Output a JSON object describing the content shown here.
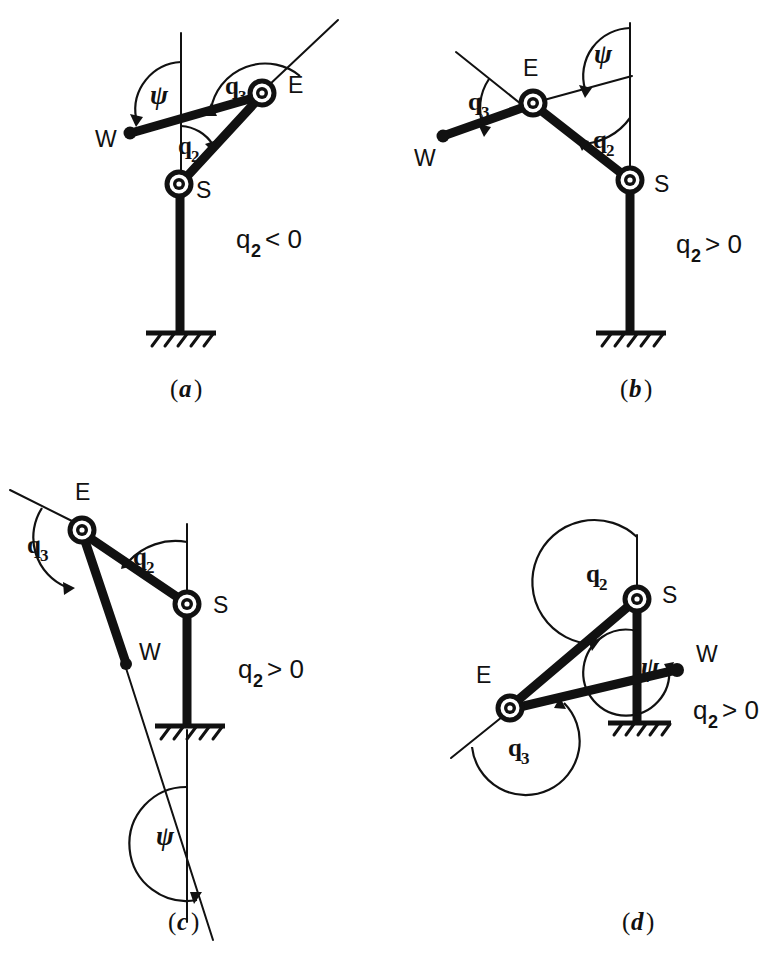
{
  "figure": {
    "kind": "technical-line-diagram",
    "background_color": "#ffffff",
    "ink_color": "#111111",
    "panels": [
      {
        "id": "a",
        "caption": "(a)",
        "caption_letter": "a",
        "condition": {
          "symbol": "q",
          "subscript": "2",
          "relation": "<",
          "value": "0",
          "text": "q2 < 0"
        },
        "points": [
          {
            "name": "S",
            "label": "S",
            "role": "shoulder-joint"
          },
          {
            "name": "E",
            "label": "E",
            "role": "elbow-joint"
          },
          {
            "name": "W",
            "label": "W",
            "role": "wrist-point"
          }
        ],
        "angles": [
          {
            "name": "q2",
            "base": "q",
            "sub": "2",
            "at": "S"
          },
          {
            "name": "q3",
            "base": "q",
            "sub": "3",
            "at": "E"
          },
          {
            "name": "psi",
            "glyph": "ψ",
            "at": "W-line"
          }
        ]
      },
      {
        "id": "b",
        "caption": "(b)",
        "caption_letter": "b",
        "condition": {
          "symbol": "q",
          "subscript": "2",
          "relation": ">",
          "value": "0",
          "text": "q2 > 0"
        },
        "points": [
          {
            "name": "S",
            "label": "S",
            "role": "shoulder-joint"
          },
          {
            "name": "E",
            "label": "E",
            "role": "elbow-joint"
          },
          {
            "name": "W",
            "label": "W",
            "role": "wrist-point"
          }
        ],
        "angles": [
          {
            "name": "q2",
            "base": "q",
            "sub": "2",
            "at": "S"
          },
          {
            "name": "q3",
            "base": "q",
            "sub": "3",
            "at": "E"
          },
          {
            "name": "psi",
            "glyph": "ψ",
            "at": "W-line"
          }
        ]
      },
      {
        "id": "c",
        "caption": "(c)",
        "caption_letter": "c",
        "condition": {
          "symbol": "q",
          "subscript": "2",
          "relation": ">",
          "value": "0",
          "text": "q2 > 0"
        },
        "points": [
          {
            "name": "S",
            "label": "S",
            "role": "shoulder-joint"
          },
          {
            "name": "E",
            "label": "E",
            "role": "elbow-joint"
          },
          {
            "name": "W",
            "label": "W",
            "role": "wrist-point"
          }
        ],
        "angles": [
          {
            "name": "q2",
            "base": "q",
            "sub": "2",
            "at": "S"
          },
          {
            "name": "q3",
            "base": "q",
            "sub": "3",
            "at": "E"
          },
          {
            "name": "psi",
            "glyph": "ψ",
            "at": "W-line"
          }
        ]
      },
      {
        "id": "d",
        "caption": "(d)",
        "caption_letter": "d",
        "condition": {
          "symbol": "q",
          "subscript": "2",
          "relation": ">",
          "value": "0",
          "text": "q2 > 0"
        },
        "points": [
          {
            "name": "S",
            "label": "S",
            "role": "shoulder-joint"
          },
          {
            "name": "E",
            "label": "E",
            "role": "elbow-joint"
          },
          {
            "name": "W",
            "label": "W",
            "role": "wrist-point"
          }
        ],
        "angles": [
          {
            "name": "q2",
            "base": "q",
            "sub": "2",
            "at": "S"
          },
          {
            "name": "q3",
            "base": "q",
            "sub": "3",
            "at": "E"
          },
          {
            "name": "psi",
            "glyph": "ψ",
            "at": "W-line"
          }
        ]
      }
    ],
    "labels": {
      "S": "S",
      "E": "E",
      "W": "W",
      "q": "q",
      "two": "2",
      "three": "3",
      "psi": "ψ",
      "lt_zero": "< 0",
      "gt_zero": "> 0",
      "zero": "0",
      "lt": "<",
      "gt": ">"
    }
  }
}
